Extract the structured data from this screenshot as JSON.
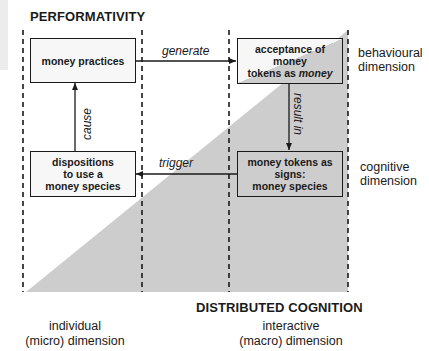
{
  "title_top": "PERFORMATIVITY",
  "title_bottom": "DISTRIBUTED COGNITION",
  "boxes": {
    "money_practices": {
      "lines": [
        "money practices"
      ]
    },
    "acceptance": {
      "line1": "acceptance of",
      "line2": "money",
      "line3_plain": "tokens as ",
      "line3_italic": "money"
    },
    "dispositions": {
      "lines": [
        "dispositions",
        "to use a",
        "money species"
      ]
    },
    "money_tokens": {
      "lines": [
        "money tokens as",
        "signs:",
        "money species"
      ]
    }
  },
  "edges": {
    "generate": "generate",
    "result_in": "result in",
    "trigger": "trigger",
    "cause": "cause"
  },
  "right_labels": {
    "behavioural": [
      "behavioural",
      "dimension"
    ],
    "cognitive": [
      "cognitive",
      "dimension"
    ]
  },
  "bottom_labels": {
    "individual": [
      "individual",
      "(micro) dimension"
    ],
    "interactive": [
      "interactive",
      "(macro) dimension"
    ]
  },
  "colors": {
    "triangle_fill": "#cdcdcd",
    "line": "#1a1a1a",
    "background": "#ffffff"
  }
}
